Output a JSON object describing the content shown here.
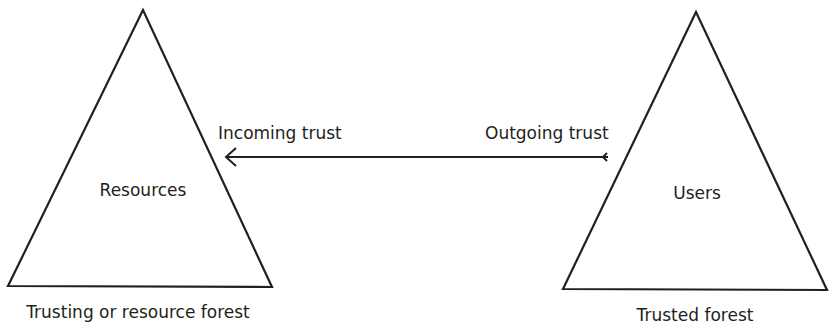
{
  "diagram": {
    "type": "forest-trust",
    "colors": {
      "stroke": "#231f20",
      "text": "#231f20",
      "background": "#ffffff"
    },
    "left_forest": {
      "inner_label": "Resources",
      "caption": "Trusting or resource forest"
    },
    "right_forest": {
      "inner_label": "Users",
      "caption": "Trusted forest"
    },
    "trust_arrow": {
      "direction": "right-to-left",
      "head_label": "Incoming trust",
      "tail_label": "Outgoing trust"
    }
  }
}
